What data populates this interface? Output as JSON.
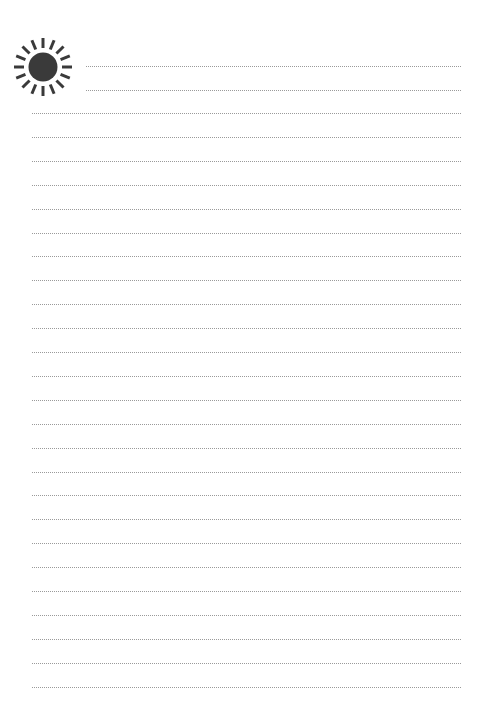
{
  "page": {
    "type": "lined-notepaper",
    "background": "#ffffff",
    "line_color": "#9a9a9a",
    "icon": {
      "name": "sun-icon",
      "color": "#3a3a3a",
      "rays": 16
    },
    "short_lines": {
      "count": 2,
      "x_start": 86,
      "x_end": 461,
      "y": [
        66,
        90
      ]
    },
    "full_lines": {
      "count": 25,
      "x_start": 32,
      "x_end": 461,
      "y_start": 113,
      "spacing": 23.9
    }
  }
}
